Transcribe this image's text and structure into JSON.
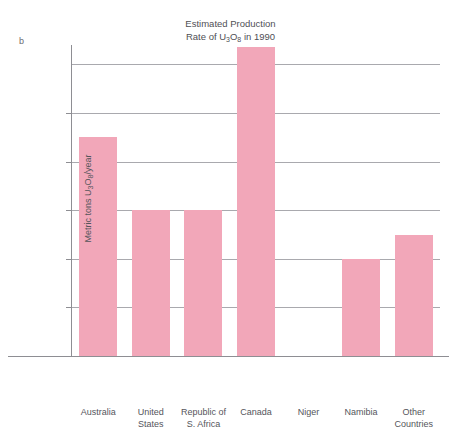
{
  "panel": {
    "letter": "b"
  },
  "chart_data": {
    "type": "bar",
    "title": "Estimated Production Rate of U3O8 in 1990",
    "title_lines": [
      "Estimated Production",
      "Rate of U₃O₈ in 1990"
    ],
    "title_line1": "Estimated Production",
    "title_line2_pre": "Rate of U",
    "title_line2_sub1": "3",
    "title_line2_mid": "O",
    "title_line2_sub2": "8",
    "title_line2_post": " in 1990",
    "xlabel": "",
    "ylabel": "Metric tons U3O8/year",
    "ylabel_pre": "Metric tons U",
    "ylabel_sub1": "3",
    "ylabel_mid": "O",
    "ylabel_sub2": "8",
    "ylabel_post": "/year",
    "ylim": [
      0,
      13000
    ],
    "grid": true,
    "legend": "none",
    "yticks": [
      2000,
      4000,
      6000,
      8000,
      10000
    ],
    "ytick_labels": [
      "2000",
      "4000",
      "6000",
      "8000",
      "10,000"
    ],
    "gridline_values": [
      2000,
      4000,
      6000,
      8000,
      10000,
      12000
    ],
    "categories": [
      "Australia",
      "United States",
      "Republic of S. Africa",
      "Canada",
      "Niger",
      "Namibia",
      "Other Countries"
    ],
    "category_label_lines": [
      [
        "Australia"
      ],
      [
        "United",
        "States"
      ],
      [
        "Republic of",
        "S. Africa"
      ],
      [
        "Canada"
      ],
      [
        "Niger"
      ],
      [
        "Namibia"
      ],
      [
        "Other",
        "Countries"
      ]
    ],
    "values": [
      9000,
      6000,
      6000,
      12700,
      0,
      4000,
      5000
    ],
    "bar_color": "#f2a7b9",
    "grid_color": "#a9a9ae",
    "axis_color": "#8e8e93",
    "text_color": "#55555b"
  }
}
